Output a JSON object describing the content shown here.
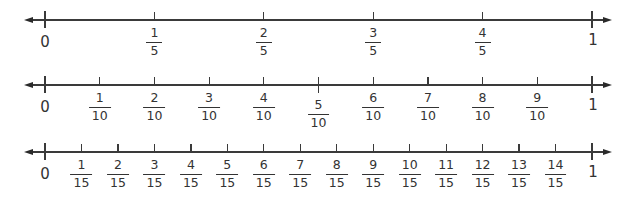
{
  "colors": {
    "line": "#3a3a3a",
    "text": "#333333",
    "background": "#ffffff"
  },
  "number_lines": [
    {
      "name": "fifths",
      "start_label": "0",
      "end_label": "1",
      "denominator": "5",
      "fractions": [
        {
          "num": "1",
          "den": "5"
        },
        {
          "num": "2",
          "den": "5"
        },
        {
          "num": "3",
          "den": "5"
        },
        {
          "num": "4",
          "den": "5"
        }
      ]
    },
    {
      "name": "tenths",
      "start_label": "0",
      "end_label": "1",
      "denominator": "10",
      "fractions": [
        {
          "num": "1",
          "den": "10"
        },
        {
          "num": "2",
          "den": "10"
        },
        {
          "num": "3",
          "den": "10"
        },
        {
          "num": "4",
          "den": "10"
        },
        {
          "num": "5",
          "den": "10"
        },
        {
          "num": "6",
          "den": "10"
        },
        {
          "num": "7",
          "den": "10"
        },
        {
          "num": "8",
          "den": "10"
        },
        {
          "num": "9",
          "den": "10"
        }
      ]
    },
    {
      "name": "fifteenths",
      "start_label": "0",
      "end_label": "1",
      "denominator": "15",
      "fractions": [
        {
          "num": "1",
          "den": "15"
        },
        {
          "num": "2",
          "den": "15"
        },
        {
          "num": "3",
          "den": "15"
        },
        {
          "num": "4",
          "den": "15"
        },
        {
          "num": "5",
          "den": "15"
        },
        {
          "num": "6",
          "den": "15"
        },
        {
          "num": "7",
          "den": "15"
        },
        {
          "num": "8",
          "den": "15"
        },
        {
          "num": "9",
          "den": "15"
        },
        {
          "num": "10",
          "den": "15"
        },
        {
          "num": "11",
          "den": "15"
        },
        {
          "num": "12",
          "den": "15"
        },
        {
          "num": "13",
          "den": "15"
        },
        {
          "num": "14",
          "den": "15"
        }
      ]
    }
  ]
}
